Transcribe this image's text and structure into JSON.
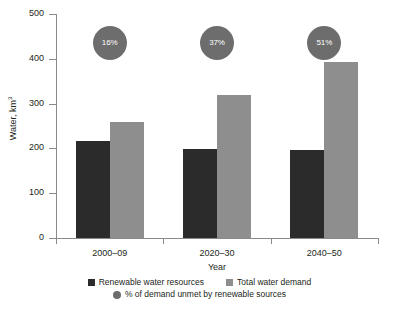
{
  "chart_data": {
    "type": "bar",
    "title": "",
    "xlabel": "Year",
    "ylabel": "Water, km",
    "ylabel_superscript": "3",
    "categories": [
      "2000–09",
      "2020–30",
      "2040–50"
    ],
    "ylim": [
      0,
      500
    ],
    "yticks": [
      0,
      100,
      200,
      300,
      400,
      500
    ],
    "ytick_labels": [
      "0",
      "100",
      "200",
      "300",
      "400",
      "500"
    ],
    "grid": false,
    "legend_position": "bottom",
    "series": [
      {
        "name": "Renewable water resources",
        "type": "bar",
        "color": "#2b2b2b",
        "values": [
          217,
          198,
          196
        ]
      },
      {
        "name": "Total water demand",
        "type": "bar",
        "color": "#8e8e8e",
        "values": [
          260,
          319,
          393
        ]
      },
      {
        "name": "% of demand unmet by renewable sources",
        "type": "bubble",
        "color": "#6d6d6d",
        "values": [
          16,
          37,
          51
        ],
        "labels": [
          "16%",
          "37%",
          "51%"
        ]
      }
    ]
  },
  "legend": {
    "items": [
      {
        "label": "Renewable water resources",
        "marker": "square-dark-icon"
      },
      {
        "label": "Total water demand",
        "marker": "square-light-icon"
      },
      {
        "label": "% of demand unmet by renewable sources",
        "marker": "circle-gray-icon"
      }
    ]
  }
}
